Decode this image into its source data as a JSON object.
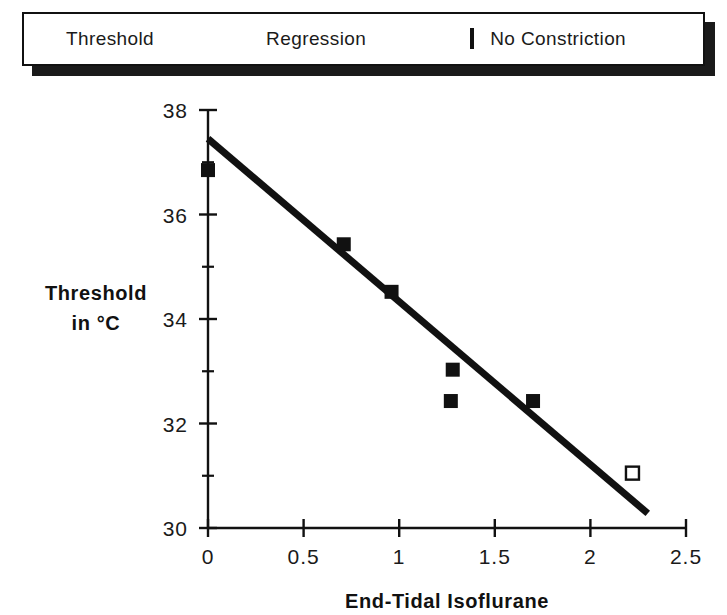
{
  "legend": {
    "items": [
      {
        "label": "Threshold",
        "key": "filled-square-marker",
        "color": "#111111"
      },
      {
        "label": "Regression",
        "key": "line-segment",
        "color": "#111111"
      },
      {
        "label": "No Constriction",
        "key": "open-square-marker",
        "color": "#111111"
      }
    ]
  },
  "chart_data": {
    "type": "scatter",
    "title": "",
    "xlabel": "End-Tidal  Isoflurane",
    "ylabel": "Threshold\nin °C",
    "ylabel_line1": "Threshold",
    "ylabel_line2": "in °C",
    "xlim": [
      0,
      2.5
    ],
    "ylim": [
      30,
      38
    ],
    "xticks": [
      0,
      0.5,
      1,
      1.5,
      2,
      2.5
    ],
    "xticklabels": [
      "0",
      "0.5",
      "1",
      "1.5",
      "2",
      "2.5"
    ],
    "yticks": [
      30,
      32,
      34,
      36,
      38
    ],
    "yticklabels": [
      "30",
      "32",
      "34",
      "36",
      "38"
    ],
    "y_minor_ticks": [
      31,
      33,
      35,
      37
    ],
    "grid": false,
    "legend_position": "above-plot",
    "series": [
      {
        "name": "Threshold",
        "marker": "filled-square",
        "color": "#111111",
        "points": [
          {
            "x": 0.0,
            "y": 36.85
          },
          {
            "x": 0.71,
            "y": 35.43
          },
          {
            "x": 0.96,
            "y": 34.52
          },
          {
            "x": 1.28,
            "y": 33.03
          },
          {
            "x": 1.27,
            "y": 32.43
          },
          {
            "x": 1.7,
            "y": 32.43
          }
        ]
      },
      {
        "name": "No Constriction",
        "marker": "open-square",
        "color": "#111111",
        "points": [
          {
            "x": 2.22,
            "y": 31.05
          }
        ]
      },
      {
        "name": "Regression",
        "marker": "line",
        "color": "#111111",
        "line_endpoints": [
          {
            "x": 0.0,
            "y": 37.45
          },
          {
            "x": 2.3,
            "y": 30.28
          }
        ]
      }
    ]
  }
}
